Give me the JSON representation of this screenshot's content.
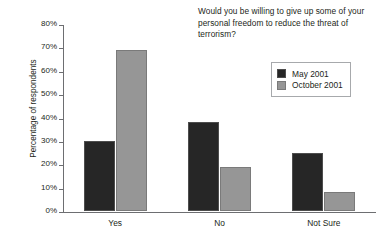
{
  "chart_data": {
    "type": "bar",
    "title": "Would you be willing to give up some of your personal freedom to reduce the threat of terrorism?",
    "xlabel": "",
    "ylabel": "Percentage of respondents",
    "categories": [
      "Yes",
      "No",
      "Not Sure"
    ],
    "series": [
      {
        "name": "May 2001",
        "color": "#262626",
        "values": [
          30,
          38,
          25
        ]
      },
      {
        "name": "October 2001",
        "color": "#969696",
        "values": [
          69,
          19,
          8
        ]
      }
    ],
    "ylim": [
      0,
      80
    ],
    "ytick_step": 10,
    "ytick_labels": [
      "0%",
      "10%",
      "20%",
      "30%",
      "40%",
      "50%",
      "60%",
      "70%",
      "80%"
    ],
    "ytick_values": [
      0,
      10,
      20,
      30,
      40,
      50,
      60,
      70,
      80
    ],
    "grid": false,
    "legend_position": "top-right"
  }
}
